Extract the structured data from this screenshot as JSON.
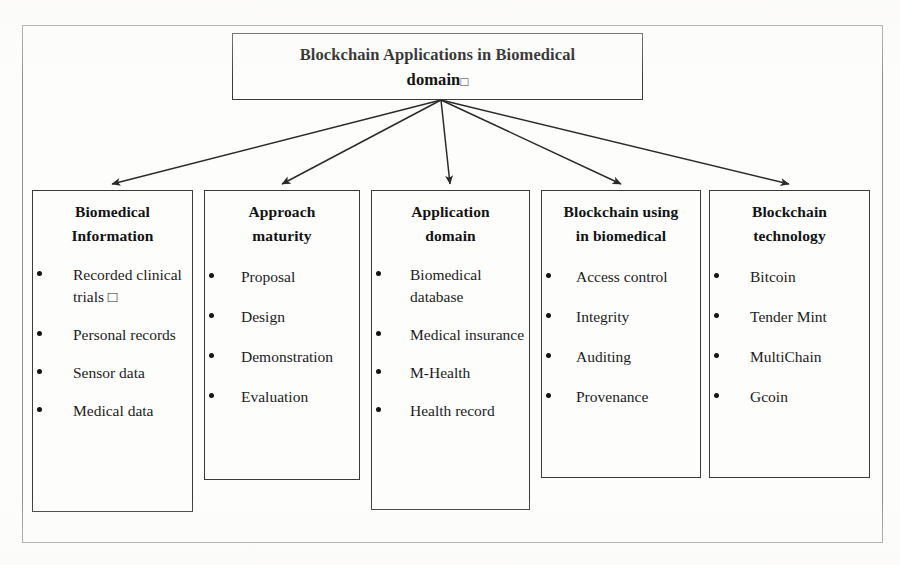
{
  "diagram": {
    "title_box": {
      "line1": "Blockchain Applications in Biomedical",
      "line2": "domain",
      "trailing_glyph": "□"
    },
    "columns": [
      {
        "id": "biomedical-information",
        "heading_line1": "Biomedical",
        "heading_line2": "Information",
        "items": [
          "Recorded clinical trials □",
          "Personal records",
          "Sensor data",
          "Medical data"
        ]
      },
      {
        "id": "approach-maturity",
        "heading_line1": "Approach",
        "heading_line2": "maturity",
        "items": [
          "Proposal",
          "Design",
          "Demonstration",
          "Evaluation"
        ]
      },
      {
        "id": "application-domain",
        "heading_line1": "Application",
        "heading_line2": "domain",
        "items": [
          "Biomedical database",
          "Medical insurance",
          "M-Health",
          "Health record"
        ]
      },
      {
        "id": "blockchain-using-in-biomedical",
        "heading_line1": "Blockchain using",
        "heading_line2": "in biomedical",
        "items": [
          "Access control",
          "Integrity",
          "Auditing",
          "Provenance"
        ]
      },
      {
        "id": "blockchain-technology",
        "heading_line1": "Blockchain",
        "heading_line2": "technology",
        "items": [
          "Bitcoin",
          "Tender Mint",
          "MultiChain",
          "Gcoin"
        ]
      }
    ],
    "connectors": {
      "origin": {
        "x": 441,
        "y": 100
      },
      "targets": [
        {
          "x": 112,
          "y": 184
        },
        {
          "x": 282,
          "y": 184
        },
        {
          "x": 450,
          "y": 184
        },
        {
          "x": 621,
          "y": 184
        },
        {
          "x": 789,
          "y": 184
        }
      ],
      "stroke": "#2b2b2b"
    },
    "colors": {
      "box_border": "#3b3b3b",
      "frame_border": "#8f8f8f",
      "text": "#1a1a1a",
      "background": "#fdfdfc"
    }
  }
}
